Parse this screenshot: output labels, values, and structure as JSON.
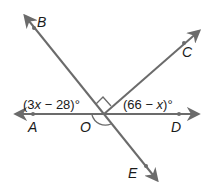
{
  "diagram": {
    "type": "geometry-angles",
    "points": {
      "A": "A",
      "B": "B",
      "C": "C",
      "D": "D",
      "E": "E",
      "O": "O"
    },
    "angle_labels": {
      "left": {
        "open": "(3",
        "var": "x",
        "rest": " − 28)°"
      },
      "right": {
        "open": "(66 − ",
        "var": "x",
        "rest": ")°"
      }
    },
    "colors": {
      "line": "#6b6b6b",
      "text": "#1a1a1a"
    }
  }
}
